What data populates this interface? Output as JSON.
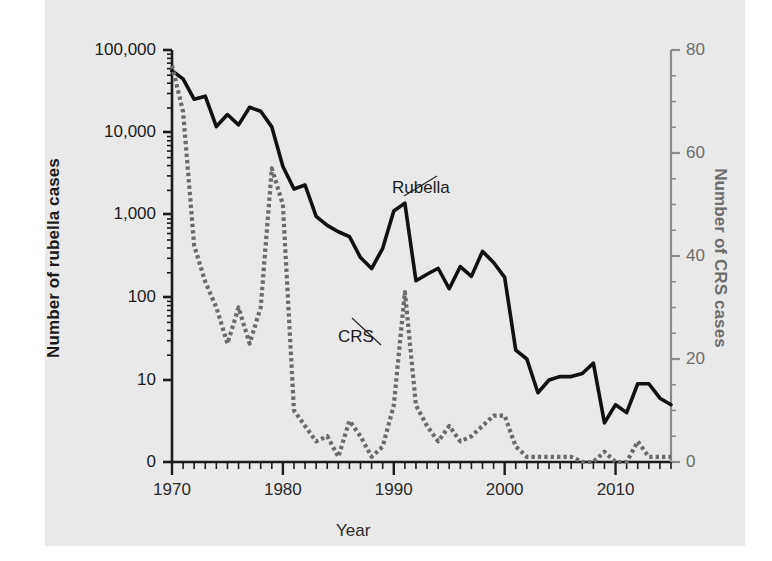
{
  "figure": {
    "background": "#ffffff",
    "panel_color": "#e9e9e9",
    "x_axis_label": "Year",
    "left_axis_label": "Number of rubella cases",
    "right_axis_label": "Number of CRS cases",
    "rubella_label": "Rubella",
    "crs_label": "CRS",
    "rubella_color": "#111111",
    "crs_color": "#6b6b6b"
  },
  "chart_data": {
    "type": "line",
    "title": "",
    "xlabel": "Year",
    "ylabel": "Number of rubella cases",
    "y2label": "Number of CRS cases",
    "grid": false,
    "legend": "inline-annotations",
    "xlim": [
      1970,
      2015
    ],
    "x_tick_labels": [
      "1970",
      "1980",
      "1990",
      "2000",
      "2010"
    ],
    "x_major_ticks": [
      1970,
      1980,
      1990,
      2000,
      2010
    ],
    "x_minor_tick_interval": 1,
    "yscale_left": "log-with-zero-baseline",
    "y_left_tick_labels": [
      "100,000",
      "10,000",
      "1,000",
      "100",
      "10",
      "0"
    ],
    "y_left_ticks": [
      100000,
      10000,
      1000,
      100,
      10,
      0
    ],
    "ylim_right": [
      0,
      80
    ],
    "y_right_ticks": [
      0,
      20,
      40,
      60,
      80
    ],
    "y_right_tick_labels": [
      "0",
      "20",
      "40",
      "60",
      "80"
    ],
    "x": [
      1970,
      1971,
      1972,
      1973,
      1974,
      1975,
      1976,
      1977,
      1978,
      1979,
      1980,
      1981,
      1982,
      1983,
      1984,
      1985,
      1986,
      1987,
      1988,
      1989,
      1990,
      1991,
      1992,
      1993,
      1994,
      1995,
      1996,
      1997,
      1998,
      1999,
      2000,
      2001,
      2002,
      2003,
      2004,
      2005,
      2006,
      2007,
      2008,
      2009,
      2010,
      2011,
      2012,
      2013,
      2014,
      2015
    ],
    "series": [
      {
        "name": "Rubella",
        "axis": "left",
        "color": "#111111",
        "style": "solid",
        "values": [
          56552,
          45086,
          25507,
          27804,
          11917,
          16652,
          12491,
          20395,
          18269,
          11795,
          3904,
          2077,
          2325,
          970,
          752,
          630,
          551,
          306,
          225,
          396,
          1125,
          1401,
          160,
          192,
          227,
          128,
          238,
          181,
          364,
          267,
          176,
          23,
          18,
          7,
          10,
          11,
          11,
          12,
          16,
          3,
          5,
          4,
          9,
          9,
          6,
          5
        ]
      },
      {
        "name": "CRS",
        "axis": "right",
        "color": "#6b6b6b",
        "style": "dotted",
        "values": [
          77,
          68,
          42,
          35,
          30,
          23,
          30,
          23,
          30,
          57,
          50,
          10,
          7,
          4,
          5,
          1,
          8,
          5,
          1,
          3,
          11,
          33,
          11,
          7,
          4,
          7,
          4,
          5,
          7,
          9,
          9,
          3,
          1,
          1,
          1,
          1,
          1,
          0,
          0,
          2,
          0,
          0,
          4,
          1,
          1,
          1
        ]
      }
    ]
  }
}
